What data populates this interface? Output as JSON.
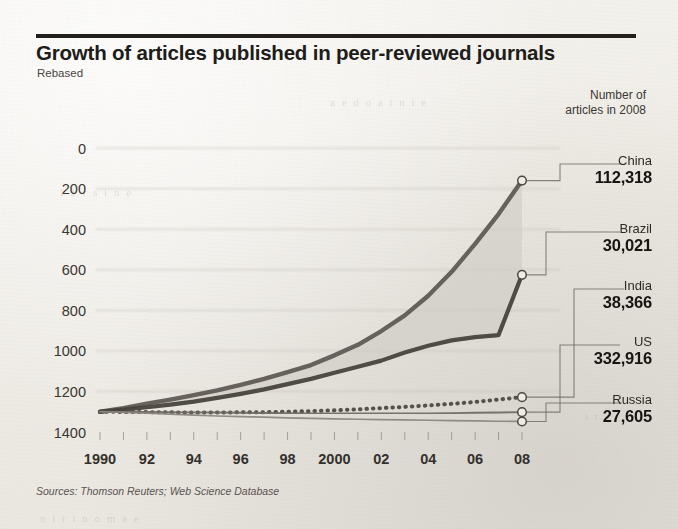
{
  "header": {
    "title": "Growth of articles published in peer-reviewed journals",
    "subtitle": "Rebased",
    "legend_header_line1": "Number of",
    "legend_header_line2": "articles in 2008"
  },
  "source": "Sources: Thomson Reuters; Web Science Database",
  "labels": {
    "china_name": "China",
    "china_value": "112,318",
    "brazil_name": "Brazil",
    "brazil_value": "30,021",
    "india_name": "India",
    "india_value": "38,366",
    "us_name": "US",
    "us_value": "332,916",
    "russia_name": "Russia",
    "russia_value": "27,605"
  },
  "yticks": [
    "1400",
    "1200",
    "1000",
    "800",
    "600",
    "400",
    "200",
    "0"
  ],
  "xticks": [
    "1990",
    "92",
    "94",
    "96",
    "98",
    "2000",
    "02",
    "04",
    "06",
    "08"
  ],
  "colors": {
    "ink": "#231f1c",
    "line_china": "#5d5852",
    "line_brazil": "#443f3a",
    "line_india": "#4b4641",
    "line_us": "#6f6a64",
    "line_russia": "#8a857e",
    "band_fill": "#cfccc5",
    "grid": "#b9b5ad",
    "paper": "#f1eee9"
  },
  "chart_data": {
    "type": "line",
    "title": "Growth of articles published in peer-reviewed journals",
    "subtitle": "Rebased",
    "xlabel": "",
    "ylabel": "",
    "xlim": [
      1990,
      2008
    ],
    "ylim": [
      0,
      1450
    ],
    "yticks": [
      0,
      200,
      400,
      600,
      800,
      1000,
      1200,
      1400
    ],
    "xtick_values": [
      1990,
      1992,
      1994,
      1996,
      1998,
      2000,
      2002,
      2004,
      2006,
      2008
    ],
    "grid": "horizontal",
    "legend_position": "right-callouts",
    "annotations": [
      "Number of articles in 2008",
      "China 112,318",
      "Brazil 30,021",
      "India 38,366",
      "US 332,916",
      "Russia 27,605"
    ],
    "x": [
      1990,
      1991,
      1992,
      1993,
      1994,
      1995,
      1996,
      1997,
      1998,
      1999,
      2000,
      2001,
      2002,
      2003,
      2004,
      2005,
      2006,
      2007,
      2008
    ],
    "series": [
      {
        "name": "China",
        "style": "solid-thick",
        "articles_2008": 112318,
        "values": [
          100,
          118,
          140,
          160,
          182,
          205,
          232,
          262,
          295,
          330,
          378,
          430,
          498,
          575,
          672,
          790,
          928,
          1075,
          1240
        ]
      },
      {
        "name": "Brazil",
        "style": "solid-thick",
        "articles_2008": 30021,
        "values": [
          100,
          110,
          122,
          135,
          150,
          168,
          188,
          210,
          236,
          262,
          292,
          322,
          352,
          392,
          425,
          452,
          468,
          478,
          775
        ]
      },
      {
        "name": "India",
        "style": "dotted",
        "articles_2008": 38366,
        "values": [
          100,
          99,
          98,
          97,
          96,
          96,
          97,
          98,
          100,
          103,
          107,
          112,
          118,
          124,
          131,
          139,
          148,
          160,
          172
        ]
      },
      {
        "name": "US",
        "style": "solid-thin",
        "articles_2008": 332916,
        "values": [
          100,
          100,
          99,
          98,
          97,
          96,
          95,
          94,
          93,
          92,
          92,
          91,
          91,
          91,
          92,
          93,
          95,
          96,
          98
        ]
      },
      {
        "name": "Russia",
        "style": "solid-thin",
        "articles_2008": 27605,
        "values": [
          100,
          97,
          93,
          88,
          83,
          79,
          76,
          73,
          70,
          67,
          65,
          63,
          61,
          60,
          58,
          56,
          55,
          53,
          52
        ]
      }
    ],
    "shaded_band": {
      "between": [
        "China",
        "Brazil"
      ],
      "fill": "#cfccc5"
    }
  }
}
